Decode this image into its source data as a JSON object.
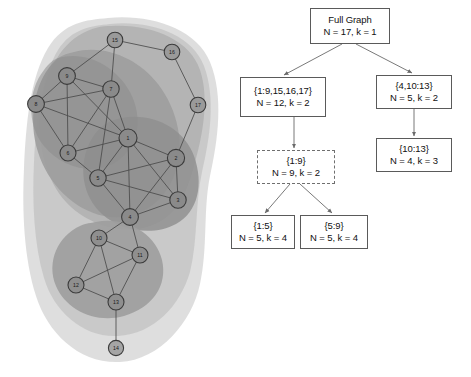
{
  "figure": {
    "background_color": "#ffffff"
  },
  "graph_panel": {
    "name": "network-graph",
    "node_count": 17,
    "node_fill": "#8c8c8c",
    "node_stroke": "#3b3b3b",
    "edge_color": "#4a4a4a",
    "blob_color": "#9a9a9a",
    "nodes": [
      {
        "id": "1",
        "label": "1",
        "x": 128,
        "y": 138,
        "r": 9.0,
        "fill": "#8a8a8a"
      },
      {
        "id": "2",
        "label": "2",
        "x": 176,
        "y": 158,
        "r": 8.6,
        "fill": "#8a8a8a"
      },
      {
        "id": "3",
        "label": "3",
        "x": 178,
        "y": 200,
        "r": 8.2,
        "fill": "#8a8a8a"
      },
      {
        "id": "4",
        "label": "4",
        "x": 130,
        "y": 217,
        "r": 8.4,
        "fill": "#8a8a8a"
      },
      {
        "id": "5",
        "label": "5",
        "x": 98,
        "y": 178,
        "r": 8.2,
        "fill": "#8a8a8a"
      },
      {
        "id": "6",
        "label": "6",
        "x": 68,
        "y": 153,
        "r": 8.0,
        "fill": "#8a8a8a"
      },
      {
        "id": "7",
        "label": "7",
        "x": 111,
        "y": 89,
        "r": 8.2,
        "fill": "#8a8a8a"
      },
      {
        "id": "8",
        "label": "8",
        "x": 36,
        "y": 104,
        "r": 8.4,
        "fill": "#8a8a8a"
      },
      {
        "id": "9",
        "label": "9",
        "x": 67,
        "y": 76,
        "r": 8.4,
        "fill": "#8a8a8a"
      },
      {
        "id": "10",
        "label": "10",
        "x": 99,
        "y": 238,
        "r": 8.0,
        "fill": "#8f8f8f"
      },
      {
        "id": "11",
        "label": "11",
        "x": 140,
        "y": 255,
        "r": 8.0,
        "fill": "#8f8f8f"
      },
      {
        "id": "12",
        "label": "12",
        "x": 76,
        "y": 285,
        "r": 8.0,
        "fill": "#8f8f8f"
      },
      {
        "id": "13",
        "label": "13",
        "x": 116,
        "y": 302,
        "r": 8.0,
        "fill": "#8f8f8f"
      },
      {
        "id": "14",
        "label": "14",
        "x": 116,
        "y": 348,
        "r": 7.6,
        "fill": "#a5a5a5"
      },
      {
        "id": "15",
        "label": "15",
        "x": 115,
        "y": 40,
        "r": 7.8,
        "fill": "#9a9a9a"
      },
      {
        "id": "16",
        "label": "16",
        "x": 172,
        "y": 52,
        "r": 7.8,
        "fill": "#9a9a9a"
      },
      {
        "id": "17",
        "label": "17",
        "x": 198,
        "y": 105,
        "r": 7.8,
        "fill": "#9a9a9a"
      }
    ],
    "edges": [
      [
        "1",
        "2"
      ],
      [
        "1",
        "3"
      ],
      [
        "1",
        "4"
      ],
      [
        "1",
        "5"
      ],
      [
        "1",
        "6"
      ],
      [
        "1",
        "7"
      ],
      [
        "1",
        "8"
      ],
      [
        "1",
        "9"
      ],
      [
        "2",
        "3"
      ],
      [
        "2",
        "4"
      ],
      [
        "2",
        "5"
      ],
      [
        "2",
        "17"
      ],
      [
        "3",
        "4"
      ],
      [
        "3",
        "5"
      ],
      [
        "4",
        "5"
      ],
      [
        "4",
        "10"
      ],
      [
        "4",
        "11"
      ],
      [
        "5",
        "6"
      ],
      [
        "5",
        "7"
      ],
      [
        "6",
        "7"
      ],
      [
        "6",
        "8"
      ],
      [
        "6",
        "9"
      ],
      [
        "7",
        "8"
      ],
      [
        "7",
        "9"
      ],
      [
        "7",
        "15"
      ],
      [
        "8",
        "9"
      ],
      [
        "9",
        "15"
      ],
      [
        "10",
        "11"
      ],
      [
        "10",
        "12"
      ],
      [
        "10",
        "13"
      ],
      [
        "11",
        "12"
      ],
      [
        "11",
        "13"
      ],
      [
        "12",
        "13"
      ],
      [
        "13",
        "14"
      ],
      [
        "15",
        "16"
      ],
      [
        "16",
        "17"
      ]
    ]
  },
  "tree_panel": {
    "name": "decomposition-tree",
    "boxes": [
      {
        "id": "root",
        "line1": "Full Graph",
        "line2": "N = 17, k = 1",
        "x": 78,
        "y": 8,
        "w": 80,
        "h": 36,
        "style": "solid"
      },
      {
        "id": "left-1",
        "line1": "{1:9,15,16,17}",
        "line2": "N = 12, k = 2",
        "x": 8,
        "y": 77,
        "w": 86,
        "h": 40,
        "style": "solid"
      },
      {
        "id": "right-1",
        "line1": "{4,10:13}",
        "line2": "N = 5, k = 2",
        "x": 144,
        "y": 75,
        "w": 76,
        "h": 34,
        "style": "solid"
      },
      {
        "id": "left-2",
        "line1": "{1:9}",
        "line2": "N = 9, k = 2",
        "x": 25,
        "y": 150,
        "w": 78,
        "h": 34,
        "style": "dashed"
      },
      {
        "id": "right-2",
        "line1": "{10:13}",
        "line2": "N = 4, k = 3",
        "x": 144,
        "y": 138,
        "w": 76,
        "h": 34,
        "style": "solid"
      },
      {
        "id": "leaf-left",
        "line1": "{1:5}",
        "line2": "N = 5, k = 4",
        "x": -1,
        "y": 215,
        "w": 64,
        "h": 34,
        "style": "solid"
      },
      {
        "id": "leaf-right",
        "line1": "{5:9}",
        "line2": "N = 5, k = 4",
        "x": 68,
        "y": 215,
        "w": 68,
        "h": 34,
        "style": "solid"
      }
    ],
    "edges": [
      {
        "from": "root",
        "to": "left-1",
        "x1": 110,
        "y1": 44,
        "x2": 52,
        "y2": 75
      },
      {
        "from": "root",
        "to": "right-1",
        "x1": 124,
        "y1": 44,
        "x2": 180,
        "y2": 73
      },
      {
        "from": "left-1",
        "to": "left-2",
        "x1": 62,
        "y1": 117,
        "x2": 62,
        "y2": 148
      },
      {
        "from": "right-1",
        "to": "right-2",
        "x1": 182,
        "y1": 109,
        "x2": 182,
        "y2": 136
      },
      {
        "from": "left-2",
        "to": "leaf-left",
        "x1": 58,
        "y1": 184,
        "x2": 33,
        "y2": 213
      },
      {
        "from": "left-2",
        "to": "leaf-right",
        "x1": 68,
        "y1": 184,
        "x2": 100,
        "y2": 213
      }
    ]
  },
  "chart_data": {
    "type": "diagram",
    "graph": {
      "n_nodes": 17,
      "node_ids": [
        "1",
        "2",
        "3",
        "4",
        "5",
        "6",
        "7",
        "8",
        "9",
        "10",
        "11",
        "12",
        "13",
        "14",
        "15",
        "16",
        "17"
      ],
      "n_edges": 36
    },
    "tree": {
      "levels": [
        {
          "label": "Full Graph",
          "N": 17,
          "k": 1
        },
        {
          "label": "{1:9,15,16,17}",
          "N": 12,
          "k": 2
        },
        {
          "label": "{4,10:13}",
          "N": 5,
          "k": 2
        },
        {
          "label": "{1:9}",
          "N": 9,
          "k": 2
        },
        {
          "label": "{10:13}",
          "N": 4,
          "k": 3
        },
        {
          "label": "{1:5}",
          "N": 5,
          "k": 4
        },
        {
          "label": "{5:9}",
          "N": 5,
          "k": 4
        }
      ]
    }
  }
}
